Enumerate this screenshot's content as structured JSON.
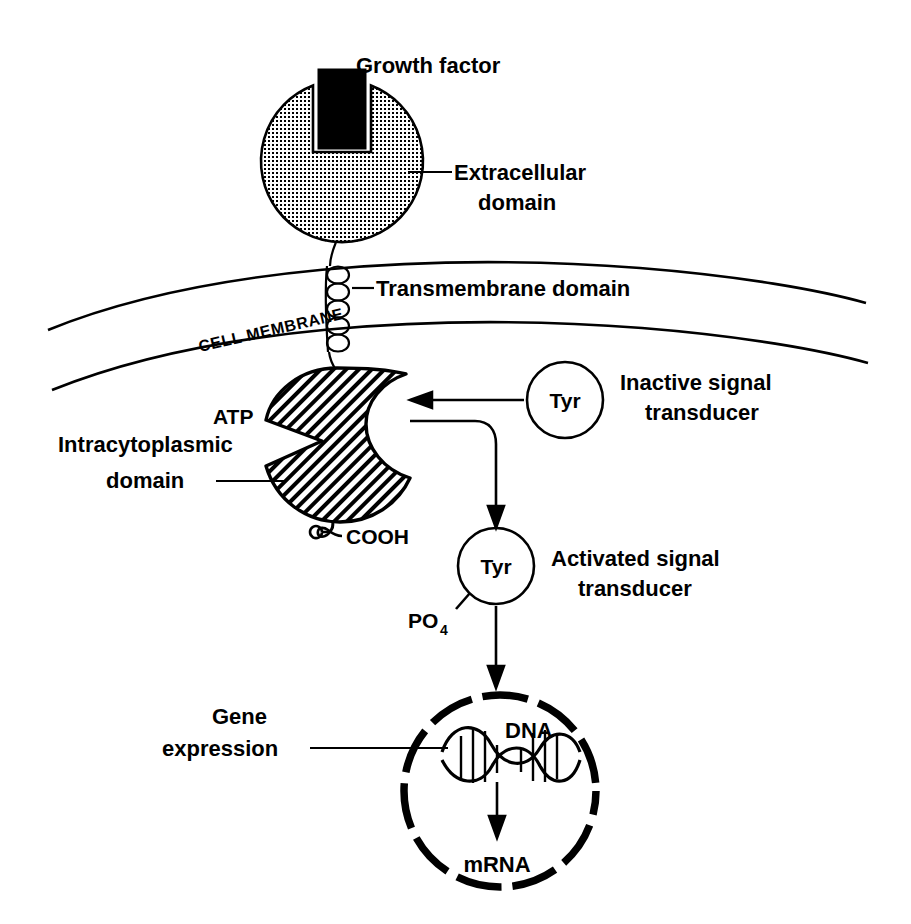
{
  "figure": {
    "background_color": "#ffffff",
    "ink_color": "#000000"
  },
  "labels": {
    "growth_factor": "Growth factor",
    "extracellular_domain_line1": "Extracellular",
    "extracellular_domain_line2": "domain",
    "transmembrane_domain": "Transmembrane domain",
    "cell_membrane": "CELL MEMBRANE",
    "atp": "ATP",
    "intracytoplasmic_line1": "Intracytoplasmic",
    "intracytoplasmic_line2": "domain",
    "cooh": "COOH",
    "tyr_inactive": "Tyr",
    "inactive_transducer_line1": "Inactive signal",
    "inactive_transducer_line2": "transducer",
    "tyr_activated": "Tyr",
    "activated_transducer_line1": "Activated signal",
    "activated_transducer_line2": "transducer",
    "phosphate": "PO",
    "phosphate_subscript": "4",
    "gene_expression_line1": "Gene",
    "gene_expression_line2": "expression",
    "dna": "DNA",
    "mrna": "mRNA"
  },
  "icons": {
    "growth_factor_block": "filled-rectangle-icon",
    "receptor_ectodomain": "stippled-circle-icon",
    "transmembrane_helix": "coil-spring-icon",
    "kinase_domain": "hatched-blob-icon",
    "transducer_inactive": "open-circle-icon",
    "transducer_activated": "open-circle-icon",
    "nucleus": "dashed-circle-icon",
    "dna_helix": "double-helix-icon",
    "arrow_binding": "left-arrow-icon",
    "arrow_phosphorylation": "curved-down-arrow-icon",
    "arrow_to_nucleus": "down-arrow-icon",
    "arrow_transcription": "down-arrow-icon"
  }
}
